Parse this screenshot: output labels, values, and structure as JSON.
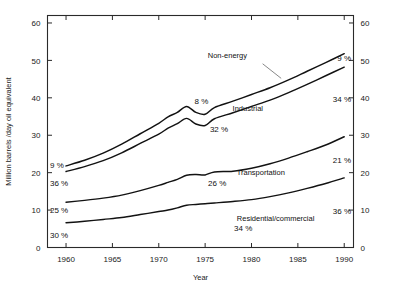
{
  "chart_data": {
    "type": "line",
    "title": "",
    "xlabel": "Year",
    "ylabel": "Million barrels /day oil equivalent",
    "xlim": [
      1958,
      1991
    ],
    "ylim": [
      0,
      62
    ],
    "xticks": [
      1960,
      1965,
      1970,
      1975,
      1980,
      1985,
      1990
    ],
    "xticklabels": [
      "1960",
      "1965",
      "1970",
      "1975",
      "1980",
      "1985",
      "1990"
    ],
    "yticks": [
      0,
      10,
      20,
      30,
      40,
      50,
      60
    ],
    "yticklabels": [
      "0",
      "10",
      "20",
      "30",
      "40",
      "50",
      "60"
    ],
    "right_axis": true,
    "right_yticklabels": [
      "0",
      "10",
      "20",
      "30",
      "40",
      "50",
      "60"
    ],
    "grid": false,
    "legend_position": "inline-annotations",
    "x": [
      1960,
      1962,
      1964,
      1966,
      1968,
      1970,
      1971,
      1972,
      1973,
      1974,
      1975,
      1976,
      1978,
      1980,
      1982,
      1984,
      1986,
      1988,
      1990
    ],
    "series": [
      {
        "name": "Residential/commercial",
        "label": "Residential/commercial",
        "label_x": 1982.6,
        "label_y": 7.0,
        "values": [
          6.6,
          7.0,
          7.5,
          8.0,
          8.8,
          9.6,
          10.0,
          10.6,
          11.3,
          11.5,
          11.7,
          11.9,
          12.3,
          12.8,
          13.6,
          14.6,
          15.8,
          17.1,
          18.6
        ],
        "start_pct": "30%",
        "end_pct": "36%"
      },
      {
        "name": "Transportation",
        "label": "Transportation",
        "label_x": 1981.0,
        "label_y": 19.3,
        "values": [
          12.1,
          12.6,
          13.2,
          14.0,
          15.2,
          16.6,
          17.4,
          18.2,
          19.3,
          19.5,
          19.4,
          20.2,
          20.4,
          21.2,
          22.4,
          23.9,
          25.6,
          27.4,
          29.6
        ],
        "start_pct": "25%",
        "end_pct": "21%"
      },
      {
        "name": "Industrial",
        "label": "Industrial",
        "label_x": 1979.6,
        "label_y": 36.4,
        "values": [
          20.3,
          21.6,
          23.2,
          25.3,
          27.8,
          30.3,
          31.9,
          33.1,
          34.5,
          33.0,
          32.6,
          34.4,
          36.0,
          37.7,
          39.4,
          41.4,
          43.6,
          45.9,
          48.2
        ],
        "start_pct": "36%",
        "end_pct": "34%"
      },
      {
        "name": "Non-energy",
        "label": "Non-energy",
        "label_x": 1977.4,
        "label_y": 50.6,
        "values": [
          21.8,
          23.3,
          25.2,
          27.6,
          30.4,
          33.2,
          34.9,
          36.1,
          37.7,
          36.1,
          35.6,
          37.4,
          39.1,
          40.9,
          42.7,
          44.8,
          47.1,
          49.4,
          51.8
        ],
        "start_pct": "9%",
        "end_pct": "9%"
      }
    ],
    "inner_pct_labels": [
      {
        "text": "32 %",
        "x": 1976.5,
        "y": 31.0
      },
      {
        "text": "26 %",
        "x": 1976.3,
        "y": 16.4
      },
      {
        "text": "34 %",
        "x": 1979.1,
        "y": 4.3
      },
      {
        "text": "8 %",
        "x": 1974.6,
        "y": 38.3
      }
    ],
    "left_pct_labels": [
      {
        "text": "9 %",
        "y": 22.2
      },
      {
        "text": "36 %",
        "y": 17.2
      },
      {
        "text": "25 %",
        "y": 10.1
      },
      {
        "text": "30 %",
        "y": 3.3
      }
    ],
    "right_pct_labels": [
      {
        "text": "9 %",
        "y": 50.6
      },
      {
        "text": "34 %",
        "y": 39.8
      },
      {
        "text": "21 %",
        "y": 23.4
      },
      {
        "text": "36 %",
        "y": 9.9
      }
    ],
    "annotation_leaders": [
      {
        "from_x": 1981.2,
        "from_y": 49.1,
        "to_x": 1983.2,
        "to_y": 45.2
      }
    ]
  }
}
